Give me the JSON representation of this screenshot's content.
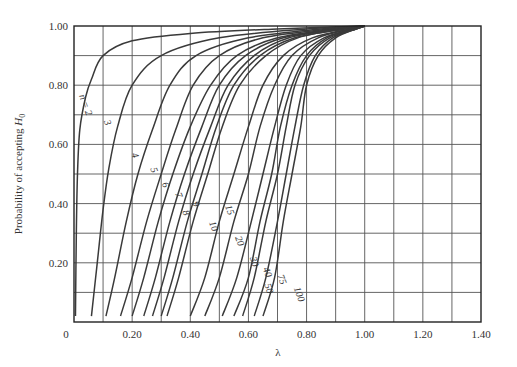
{
  "chart_data": {
    "type": "line",
    "title": "",
    "xlabel": "λ",
    "ylabel": "Probability of accepting H0",
    "ylabel_parts": {
      "main": "Probability of accepting ",
      "var": "H",
      "sub": "0"
    },
    "xlim": [
      0,
      1.4
    ],
    "ylim": [
      0,
      1.0
    ],
    "grid": true,
    "x_ticks": [
      {
        "value": 0,
        "label": "0"
      },
      {
        "value": 0.2,
        "label": "0.20"
      },
      {
        "value": 0.4,
        "label": "0.40"
      },
      {
        "value": 0.6,
        "label": "0.60"
      },
      {
        "value": 0.8,
        "label": "0.80"
      },
      {
        "value": 1.0,
        "label": "1.00"
      },
      {
        "value": 1.2,
        "label": "1.20"
      },
      {
        "value": 1.4,
        "label": "1.40"
      }
    ],
    "y_ticks": [
      {
        "value": 0.2,
        "label": "0.20"
      },
      {
        "value": 0.4,
        "label": "0.40"
      },
      {
        "value": 0.6,
        "label": "0.60"
      },
      {
        "value": 0.8,
        "label": "0.80"
      },
      {
        "value": 1.0,
        "label": "1.00"
      }
    ],
    "x_gridlines": [
      0.1,
      0.2,
      0.3,
      0.4,
      0.5,
      0.6,
      0.7,
      0.8,
      0.9,
      1.0,
      1.1,
      1.2,
      1.3
    ],
    "y_gridlines": [
      0.1,
      0.2,
      0.3,
      0.4,
      0.5,
      0.6,
      0.7,
      0.8,
      0.9
    ],
    "series": [
      {
        "name": "n = 2",
        "label": "n = 2",
        "label_pos": [
          0.03,
          0.73
        ],
        "points": [
          [
            0.005,
            0.02
          ],
          [
            0.008,
            0.3
          ],
          [
            0.012,
            0.5
          ],
          [
            0.02,
            0.65
          ],
          [
            0.04,
            0.76
          ],
          [
            0.06,
            0.82
          ],
          [
            0.1,
            0.9
          ],
          [
            0.2,
            0.95
          ],
          [
            0.4,
            0.975
          ],
          [
            0.7,
            0.99
          ],
          [
            1.0,
            1.0
          ]
        ]
      },
      {
        "name": "n = 3",
        "label": "3",
        "label_pos": [
          0.105,
          0.67
        ],
        "points": [
          [
            0.06,
            0.02
          ],
          [
            0.08,
            0.2
          ],
          [
            0.1,
            0.38
          ],
          [
            0.12,
            0.52
          ],
          [
            0.15,
            0.66
          ],
          [
            0.2,
            0.8
          ],
          [
            0.3,
            0.9
          ],
          [
            0.5,
            0.96
          ],
          [
            0.8,
            0.99
          ],
          [
            1.0,
            1.0
          ]
        ]
      },
      {
        "name": "n = 4",
        "label": "4",
        "label_pos": [
          0.2,
          0.56
        ],
        "points": [
          [
            0.11,
            0.02
          ],
          [
            0.14,
            0.15
          ],
          [
            0.18,
            0.34
          ],
          [
            0.22,
            0.5
          ],
          [
            0.27,
            0.65
          ],
          [
            0.33,
            0.8
          ],
          [
            0.42,
            0.9
          ],
          [
            0.6,
            0.96
          ],
          [
            0.85,
            0.99
          ],
          [
            1.0,
            1.0
          ]
        ]
      },
      {
        "name": "n = 5",
        "label": "5",
        "label_pos": [
          0.265,
          0.51
        ],
        "points": [
          [
            0.16,
            0.02
          ],
          [
            0.2,
            0.15
          ],
          [
            0.25,
            0.34
          ],
          [
            0.3,
            0.5
          ],
          [
            0.35,
            0.65
          ],
          [
            0.41,
            0.8
          ],
          [
            0.5,
            0.9
          ],
          [
            0.65,
            0.96
          ],
          [
            0.88,
            0.99
          ],
          [
            1.0,
            1.0
          ]
        ]
      },
      {
        "name": "n = 6",
        "label": "6",
        "label_pos": [
          0.305,
          0.46
        ],
        "points": [
          [
            0.2,
            0.02
          ],
          [
            0.24,
            0.15
          ],
          [
            0.29,
            0.34
          ],
          [
            0.34,
            0.5
          ],
          [
            0.4,
            0.66
          ],
          [
            0.47,
            0.8
          ],
          [
            0.56,
            0.9
          ],
          [
            0.7,
            0.96
          ],
          [
            0.9,
            0.99
          ],
          [
            1.0,
            1.0
          ]
        ]
      },
      {
        "name": "n = 7",
        "label": "7",
        "label_pos": [
          0.35,
          0.425
        ],
        "points": [
          [
            0.24,
            0.02
          ],
          [
            0.28,
            0.15
          ],
          [
            0.33,
            0.34
          ],
          [
            0.38,
            0.5
          ],
          [
            0.44,
            0.66
          ],
          [
            0.5,
            0.8
          ],
          [
            0.59,
            0.9
          ],
          [
            0.72,
            0.96
          ],
          [
            0.91,
            0.99
          ],
          [
            1.0,
            1.0
          ]
        ]
      },
      {
        "name": "n = 8",
        "label": "8",
        "label_pos": [
          0.375,
          0.365
        ],
        "points": [
          [
            0.27,
            0.02
          ],
          [
            0.31,
            0.15
          ],
          [
            0.36,
            0.34
          ],
          [
            0.41,
            0.5
          ],
          [
            0.47,
            0.66
          ],
          [
            0.53,
            0.8
          ],
          [
            0.62,
            0.9
          ],
          [
            0.74,
            0.96
          ],
          [
            0.92,
            0.99
          ],
          [
            1.0,
            1.0
          ]
        ]
      },
      {
        "name": "n = 9",
        "label": "9",
        "label_pos": [
          0.41,
          0.395
        ],
        "points": [
          [
            0.3,
            0.02
          ],
          [
            0.34,
            0.15
          ],
          [
            0.39,
            0.34
          ],
          [
            0.44,
            0.5
          ],
          [
            0.49,
            0.66
          ],
          [
            0.55,
            0.8
          ],
          [
            0.64,
            0.9
          ],
          [
            0.76,
            0.96
          ],
          [
            0.93,
            0.99
          ],
          [
            1.0,
            1.0
          ]
        ]
      },
      {
        "name": "n = 10",
        "label": "10",
        "label_pos": [
          0.47,
          0.32
        ],
        "points": [
          [
            0.32,
            0.02
          ],
          [
            0.36,
            0.15
          ],
          [
            0.41,
            0.34
          ],
          [
            0.46,
            0.5
          ],
          [
            0.51,
            0.66
          ],
          [
            0.57,
            0.8
          ],
          [
            0.66,
            0.9
          ],
          [
            0.77,
            0.96
          ],
          [
            0.93,
            0.99
          ],
          [
            1.0,
            1.0
          ]
        ]
      },
      {
        "name": "n = 15",
        "label": "15",
        "label_pos": [
          0.525,
          0.375
        ],
        "points": [
          [
            0.4,
            0.02
          ],
          [
            0.45,
            0.15
          ],
          [
            0.5,
            0.34
          ],
          [
            0.55,
            0.5
          ],
          [
            0.6,
            0.66
          ],
          [
            0.65,
            0.8
          ],
          [
            0.72,
            0.9
          ],
          [
            0.82,
            0.96
          ],
          [
            0.95,
            0.99
          ],
          [
            1.0,
            1.0
          ]
        ]
      },
      {
        "name": "n = 20",
        "label": "20",
        "label_pos": [
          0.56,
          0.27
        ],
        "points": [
          [
            0.45,
            0.02
          ],
          [
            0.5,
            0.15
          ],
          [
            0.55,
            0.34
          ],
          [
            0.6,
            0.5
          ],
          [
            0.64,
            0.66
          ],
          [
            0.69,
            0.8
          ],
          [
            0.75,
            0.9
          ],
          [
            0.84,
            0.96
          ],
          [
            0.95,
            0.99
          ],
          [
            1.0,
            1.0
          ]
        ]
      },
      {
        "name": "n = 30",
        "label": "30",
        "label_pos": [
          0.61,
          0.2
        ],
        "points": [
          [
            0.51,
            0.02
          ],
          [
            0.56,
            0.15
          ],
          [
            0.61,
            0.34
          ],
          [
            0.65,
            0.5
          ],
          [
            0.69,
            0.66
          ],
          [
            0.73,
            0.8
          ],
          [
            0.78,
            0.9
          ],
          [
            0.86,
            0.96
          ],
          [
            0.96,
            0.99
          ],
          [
            1.0,
            1.0
          ]
        ]
      },
      {
        "name": "n = 40",
        "label": "40",
        "label_pos": [
          0.655,
          0.165
        ],
        "points": [
          [
            0.55,
            0.02
          ],
          [
            0.6,
            0.15
          ],
          [
            0.64,
            0.34
          ],
          [
            0.68,
            0.5
          ],
          [
            0.71,
            0.66
          ],
          [
            0.75,
            0.8
          ],
          [
            0.8,
            0.9
          ],
          [
            0.87,
            0.96
          ],
          [
            0.96,
            0.99
          ],
          [
            1.0,
            1.0
          ]
        ]
      },
      {
        "name": "n = 50",
        "label": "50",
        "label_pos": [
          0.66,
          0.11
        ],
        "points": [
          [
            0.58,
            0.02
          ],
          [
            0.62,
            0.15
          ],
          [
            0.66,
            0.34
          ],
          [
            0.7,
            0.5
          ],
          [
            0.73,
            0.66
          ],
          [
            0.76,
            0.8
          ],
          [
            0.81,
            0.9
          ],
          [
            0.88,
            0.96
          ],
          [
            0.97,
            0.99
          ],
          [
            1.0,
            1.0
          ]
        ]
      },
      {
        "name": "n = 75",
        "label": "75",
        "label_pos": [
          0.705,
          0.14
        ],
        "points": [
          [
            0.62,
            0.02
          ],
          [
            0.66,
            0.15
          ],
          [
            0.7,
            0.34
          ],
          [
            0.73,
            0.5
          ],
          [
            0.76,
            0.66
          ],
          [
            0.79,
            0.8
          ],
          [
            0.83,
            0.9
          ],
          [
            0.89,
            0.96
          ],
          [
            0.97,
            0.99
          ],
          [
            1.0,
            1.0
          ]
        ]
      },
      {
        "name": "n = 100",
        "label": "100",
        "label_pos": [
          0.765,
          0.09
        ],
        "points": [
          [
            0.65,
            0.02
          ],
          [
            0.69,
            0.15
          ],
          [
            0.72,
            0.34
          ],
          [
            0.75,
            0.5
          ],
          [
            0.78,
            0.66
          ],
          [
            0.8,
            0.8
          ],
          [
            0.84,
            0.9
          ],
          [
            0.9,
            0.96
          ],
          [
            0.97,
            0.99
          ],
          [
            1.0,
            1.0
          ]
        ]
      }
    ]
  }
}
